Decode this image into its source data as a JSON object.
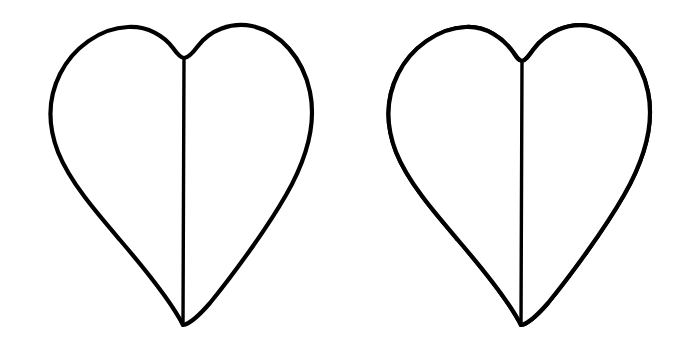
{
  "figure": {
    "caption": "",
    "background_color": "#ffffff",
    "stroke_color": "#000000",
    "fill_color": "#ffffff",
    "canvas": {
      "width": 694,
      "height": 356
    }
  },
  "panels": [
    {
      "id": "left-heart",
      "label": "Heart outline, undivided",
      "center_x": 183,
      "top_y": 27,
      "bottom_tip_y": 325,
      "left_x": 48,
      "right_x": 312,
      "cleft_y": 58,
      "has_septum": true,
      "has_hatching": false,
      "hatch_line_count": 0,
      "divider_y": null
    },
    {
      "id": "right-heart",
      "label": "Heart outline with hatched lower region",
      "center_x": 521,
      "top_y": 27,
      "bottom_tip_y": 325,
      "left_x": 385,
      "right_x": 650,
      "cleft_y": 60,
      "has_septum": true,
      "has_hatching": true,
      "hatch_line_count": 9,
      "divider_y": 234,
      "divider_x_start": 442,
      "divider_x_end": 612,
      "hatch_x_positions": [
        455,
        468,
        481,
        494,
        521,
        548,
        561,
        574,
        587
      ]
    }
  ],
  "chart_data": {
    "type": "diagram",
    "shapes": [
      {
        "name": "heart-left",
        "filled_fraction": 0.0,
        "hatched": false,
        "notes": "Plain heart outline bisected by a vertical midline"
      },
      {
        "name": "heart-right",
        "filled_fraction": 0.3,
        "hatched": true,
        "notes": "Heart outline bisected by a vertical midline; lower region below a horizontal chord is filled with 9 vertical hatch lines"
      }
    ]
  }
}
